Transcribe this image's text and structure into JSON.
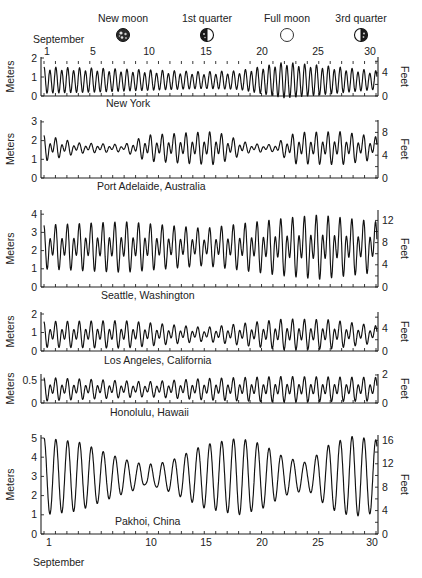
{
  "figure": {
    "month_label_top": "September",
    "month_label_bottom": "September",
    "x_units": "Day of September",
    "left_axis_unit": "Meters",
    "right_axis_unit": "Feet"
  },
  "moon_phases": [
    {
      "label": "New moon",
      "day": 8,
      "icon": "new-moon-icon"
    },
    {
      "label": "1st quarter",
      "day": 15,
      "icon": "first-quarter-moon-icon"
    },
    {
      "label": "Full moon",
      "day": 22,
      "icon": "full-moon-icon"
    },
    {
      "label": "3rd quarter",
      "day": 29,
      "icon": "third-quarter-moon-icon"
    }
  ],
  "top_day_ticks": [
    "1",
    "5",
    "10",
    "15",
    "20",
    "25",
    "30"
  ],
  "bottom_day_ticks": [
    "1",
    "10",
    "15",
    "20",
    "25",
    "30"
  ],
  "chart_data": {
    "type": "line",
    "xlabel": "September",
    "x_range": [
      1,
      30
    ],
    "x_ticks": [
      1,
      5,
      10,
      15,
      20,
      25,
      30
    ],
    "annotations": [
      "New moon (Sep 8)",
      "1st quarter (Sep 15)",
      "Full moon (Sep 22)",
      "3rd quarter (Sep 29)"
    ],
    "grid": false,
    "panels": [
      {
        "location": "New York",
        "tide_type": "semidiurnal",
        "ylabel_left": "Meters",
        "ylabel_right": "Feet",
        "ylim_m": [
          0,
          2
        ],
        "yticks_m": [
          0,
          1,
          2
        ],
        "ylim_ft": [
          0,
          6.6
        ],
        "yticks_ft": [
          0,
          4
        ],
        "mean_level_m": 0.8,
        "range_m_by_day": {
          "1": 1.3,
          "5": 1.2,
          "10": 1.0,
          "15": 0.8,
          "18": 0.9,
          "22": 1.8,
          "25": 1.5,
          "30": 0.9
        },
        "max_m": 1.85,
        "min_m": -0.1
      },
      {
        "location": "Port Adelaide, Australia",
        "tide_type": "mixed",
        "ylabel_left": "Meters",
        "ylabel_right": "Feet",
        "ylim_m": [
          0,
          3
        ],
        "yticks_m": [
          0,
          1,
          2,
          3
        ],
        "ylim_ft": [
          0,
          10
        ],
        "yticks_ft": [
          0,
          4,
          8
        ],
        "mean_level_m": 1.6,
        "range_m_by_day": {
          "1": 1.5,
          "4": 0.6,
          "8": 0.4,
          "10": 1.5,
          "14": 1.8,
          "16": 1.9,
          "19": 0.5,
          "21": 0.4,
          "23": 1.8,
          "27": 1.9,
          "30": 1.3
        },
        "max_m": 2.6,
        "min_m": 0.5
      },
      {
        "location": "Seattle, Washington",
        "tide_type": "mixed",
        "ylabel_left": "Meters",
        "ylabel_right": "Feet",
        "ylim_m": [
          0,
          4.2
        ],
        "yticks_m": [
          0,
          1,
          2,
          3,
          4
        ],
        "ylim_ft": [
          0,
          13.8
        ],
        "yticks_ft": [
          0,
          4,
          8,
          12
        ],
        "mean_level_m": 2.2,
        "range_m_by_day": {
          "1": 2.6,
          "8": 3.0,
          "15": 2.2,
          "22": 3.4,
          "25": 3.8,
          "30": 3.0
        },
        "max_m": 4.2,
        "min_m": 0.0
      },
      {
        "location": "Los Angeles, California",
        "tide_type": "mixed",
        "ylabel_left": "Meters",
        "ylabel_right": "Feet",
        "ylim_m": [
          0,
          2
        ],
        "yticks_m": [
          0,
          1,
          2
        ],
        "ylim_ft": [
          0,
          6.6
        ],
        "yticks_ft": [
          0,
          4
        ],
        "mean_level_m": 0.9,
        "range_m_by_day": {
          "1": 1.5,
          "8": 1.6,
          "15": 0.8,
          "22": 1.8,
          "26": 1.7,
          "30": 1.0
        },
        "max_m": 1.8,
        "min_m": -0.1
      },
      {
        "location": "Honolulu, Hawaii",
        "tide_type": "mixed",
        "ylabel_left": "Meters",
        "ylabel_right": "Feet",
        "ylim_m": [
          0,
          0.65
        ],
        "yticks_m": [
          0,
          0.5
        ],
        "ylim_ft": [
          0,
          2.1
        ],
        "yticks_ft": [
          0,
          2
        ],
        "mean_level_m": 0.3,
        "range_m_by_day": {
          "1": 0.55,
          "10": 0.35,
          "15": 0.5,
          "22": 0.6,
          "30": 0.55
        },
        "max_m": 0.65,
        "min_m": 0.0
      },
      {
        "location": "Pakhoi, China",
        "tide_type": "diurnal",
        "ylabel_left": "Meters",
        "ylabel_right": "Feet",
        "ylim_m": [
          0,
          5.2
        ],
        "yticks_m": [
          0,
          1,
          2,
          3,
          4,
          5
        ],
        "ylim_ft": [
          0,
          17
        ],
        "yticks_ft": [
          0,
          4,
          8,
          12,
          16
        ],
        "mean_level_m": 3.0,
        "range_m_by_day": {
          "1": 4.0,
          "4": 3.6,
          "7": 2.2,
          "10": 1.0,
          "12": 1.6,
          "15": 3.3,
          "18": 4.0,
          "20": 3.4,
          "22": 2.0,
          "24": 1.4,
          "26": 3.4,
          "28": 4.2,
          "30": 3.8
        },
        "max_m": 5.1,
        "min_m": 0.9
      }
    ]
  }
}
